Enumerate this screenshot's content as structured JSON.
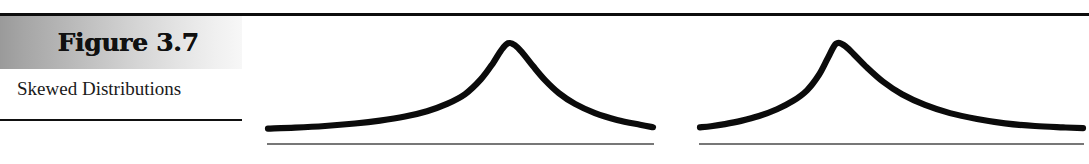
{
  "figure": {
    "number_label": "Figure 3.7",
    "caption": "Skewed Distributions"
  },
  "rules": {
    "top_rule_name": "top-horizontal-rule",
    "caption_rule_name": "caption-underline-rule"
  },
  "chart_data": [
    {
      "type": "line",
      "title": "Negatively Skewed Distribution",
      "subtitle": "",
      "xlabel": "",
      "ylabel": "",
      "grid": false,
      "legend": "none",
      "xlim": [
        0,
        390
      ],
      "ylim": [
        0,
        1
      ],
      "axis": {
        "baseline_y": 0,
        "visible": true
      },
      "skew": "negative",
      "peak_x": 243,
      "description": "Long tail extends to the left; mode located to the right of center.",
      "x": [
        3,
        30,
        60,
        90,
        115,
        140,
        162,
        182,
        200,
        216,
        228,
        236,
        243,
        250,
        258,
        268,
        280,
        294,
        310,
        330,
        352,
        375,
        388
      ],
      "y": [
        0.045,
        0.055,
        0.072,
        0.098,
        0.128,
        0.17,
        0.225,
        0.3,
        0.4,
        0.555,
        0.72,
        0.85,
        0.925,
        0.905,
        0.82,
        0.69,
        0.545,
        0.41,
        0.3,
        0.205,
        0.135,
        0.085,
        0.06
      ]
    },
    {
      "type": "line",
      "title": "Positively Skewed Distribution",
      "subtitle": "",
      "xlabel": "",
      "ylabel": "",
      "grid": false,
      "legend": "none",
      "xlim": [
        0,
        388
      ],
      "ylim": [
        0,
        1
      ],
      "axis": {
        "baseline_y": 0,
        "visible": true
      },
      "skew": "positive",
      "peak_x": 139,
      "description": "Long tail extends to the right; mode located to the left of center.",
      "x": [
        3,
        14,
        28,
        44,
        62,
        80,
        96,
        110,
        122,
        131,
        139,
        147,
        157,
        170,
        186,
        205,
        228,
        253,
        280,
        308,
        338,
        366,
        386
      ],
      "y": [
        0.058,
        0.07,
        0.092,
        0.125,
        0.175,
        0.245,
        0.33,
        0.44,
        0.6,
        0.775,
        0.92,
        0.905,
        0.81,
        0.675,
        0.53,
        0.4,
        0.29,
        0.205,
        0.145,
        0.1,
        0.072,
        0.058,
        0.05
      ]
    }
  ],
  "colors": {
    "curve_stroke": "#0b0b0b",
    "axis_stroke": "#4a4a4a",
    "rule": "#0d0d0d",
    "banner_gradient_start": "#9a9a9a",
    "banner_gradient_end": "#f7f7f7",
    "page_background": "#ffffff",
    "text": "#1a1a1a"
  }
}
